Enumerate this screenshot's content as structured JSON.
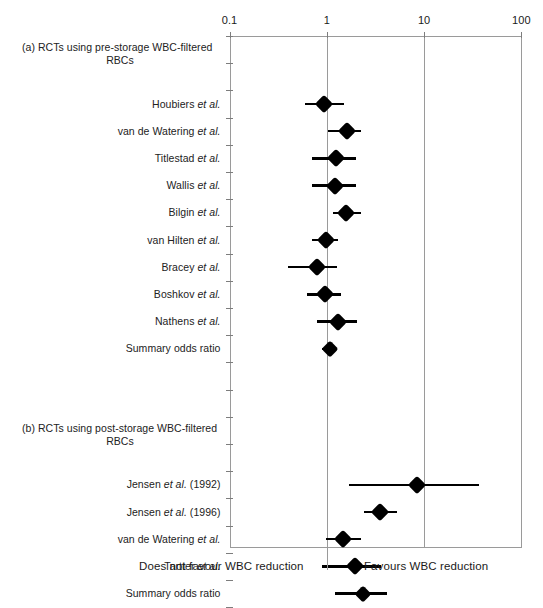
{
  "chart_data": {
    "type": "forest",
    "title": "",
    "xlabel": "Odds ratio (log scale)",
    "ylabel": "",
    "xscale": "log",
    "xlim": [
      0.1,
      100
    ],
    "tick_values": [
      0.1,
      1,
      10,
      100
    ],
    "tick_labels": [
      "0.1",
      "1",
      "10",
      "100"
    ],
    "gridlines": [
      1,
      10
    ],
    "reference_line": 1,
    "grid": false,
    "legend": "none",
    "footer_left": "Does not favour WBC reduction",
    "footer_right": "Favours WBC reduction",
    "sections": [
      {
        "id": "a",
        "heading_line1": "(a) RCTs using pre-storage WBC-filtered",
        "heading_line2": "RBCs",
        "rows": [
          {
            "label_main": "Houbiers",
            "label_italic": "et al.",
            "label_suffix": "",
            "or": 0.94,
            "ci_low": 0.6,
            "ci_high": 1.5,
            "summary": false
          },
          {
            "label_main": "van de Watering",
            "label_italic": "et al.",
            "label_suffix": "",
            "or": 1.6,
            "ci_low": 1.02,
            "ci_high": 2.25,
            "summary": false
          },
          {
            "label_main": "Titlestad",
            "label_italic": "et al.",
            "label_suffix": "",
            "or": 1.25,
            "ci_low": 0.71,
            "ci_high": 2.0,
            "summary": false
          },
          {
            "label_main": "Wallis",
            "label_italic": "et al.",
            "label_suffix": "",
            "or": 1.2,
            "ci_low": 0.7,
            "ci_high": 2.0,
            "summary": false
          },
          {
            "label_main": "Bilgin",
            "label_italic": "et al.",
            "label_suffix": "",
            "or": 1.58,
            "ci_low": 1.15,
            "ci_high": 2.25,
            "summary": false
          },
          {
            "label_main": "van Hilten",
            "label_italic": "et al.",
            "label_suffix": "",
            "or": 0.98,
            "ci_low": 0.7,
            "ci_high": 1.3,
            "summary": false
          },
          {
            "label_main": "Bracey",
            "label_italic": "et al.",
            "label_suffix": "",
            "or": 0.8,
            "ci_low": 0.4,
            "ci_high": 1.28,
            "summary": false
          },
          {
            "label_main": "Boshkov",
            "label_italic": "et al.",
            "label_suffix": "",
            "or": 0.95,
            "ci_low": 0.62,
            "ci_high": 1.4,
            "summary": false
          },
          {
            "label_main": "Nathens",
            "label_italic": "et al.",
            "label_suffix": "",
            "or": 1.3,
            "ci_low": 0.8,
            "ci_high": 2.05,
            "summary": false
          },
          {
            "label_main": "Summary odds ratio",
            "label_italic": "",
            "label_suffix": "",
            "or": 1.07,
            "ci_low": 0.9,
            "ci_high": 1.28,
            "summary": true
          }
        ]
      },
      {
        "id": "b",
        "heading_line1": "(b) RCTs using post-storage WBC-filtered",
        "heading_line2": "RBCs",
        "rows": [
          {
            "label_main": "Jensen",
            "label_italic": "et al.",
            "label_suffix": "(1992)",
            "or": 8.4,
            "ci_low": 1.7,
            "ci_high": 37.0,
            "summary": false
          },
          {
            "label_main": "Jensen",
            "label_italic": "et al.",
            "label_suffix": "(1996)",
            "or": 3.5,
            "ci_low": 2.4,
            "ci_high": 5.3,
            "summary": false
          },
          {
            "label_main": "van de Watering",
            "label_italic": "et al.",
            "label_suffix": "",
            "or": 1.45,
            "ci_low": 0.97,
            "ci_high": 2.25,
            "summary": false
          },
          {
            "label_main": "Tartter",
            "label_italic": "et al.",
            "label_suffix": "",
            "or": 1.95,
            "ci_low": 0.9,
            "ci_high": 3.6,
            "summary": false
          },
          {
            "label_main": "Summary odds ratio",
            "label_italic": "",
            "label_suffix": "",
            "or": 2.35,
            "ci_low": 1.2,
            "ci_high": 4.2,
            "summary": true
          }
        ]
      }
    ]
  }
}
